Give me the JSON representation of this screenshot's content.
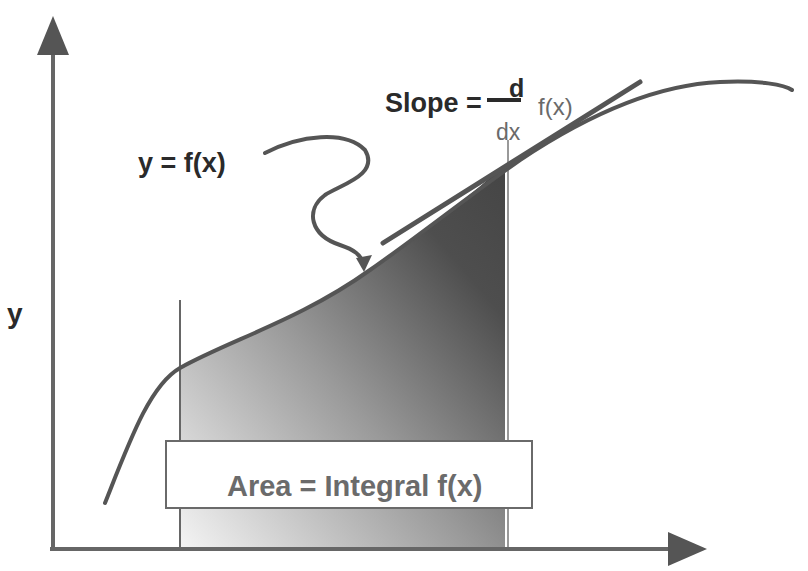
{
  "diagram": {
    "axes": {
      "y_label": "y",
      "x_label": ""
    },
    "labels": {
      "function_label": "y = f(x)",
      "slope_label": "Slope =",
      "slope_numerator": "d",
      "slope_denominator": "dx",
      "slope_function": "f(x)",
      "area_label": "Area = Integral f(x)"
    },
    "colors": {
      "curve": "#555555",
      "axes": "#666666",
      "shade_dark": "#4a4a4a",
      "shade_light": "#f2f2f2",
      "text_dark": "#2a2a2a",
      "text_grey": "#6a6a6a"
    }
  }
}
